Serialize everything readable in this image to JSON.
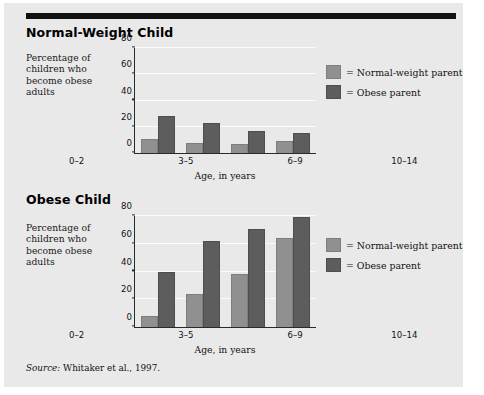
{
  "figure": {
    "source_prefix": "Source:",
    "source_text": "Whitaker et al., 1997."
  },
  "legend": {
    "normal_label": "= Normal-weight parent",
    "obese_label": "= Obese parent",
    "normal_color": "#909090",
    "obese_color": "#5d5d5d"
  },
  "panels": [
    {
      "title": "Normal-Weight Child",
      "ylabel": "Percentage of children who become obese adults",
      "xlabel": "Age, in years"
    },
    {
      "title": "Obese Child",
      "ylabel": "Percentage of children who become obese adults",
      "xlabel": "Age, in years"
    }
  ],
  "axis": {
    "ticks": [
      "0",
      "20",
      "40",
      "60",
      "80"
    ]
  },
  "chart_data": [
    {
      "type": "bar",
      "title": "Normal-Weight Child",
      "categories": [
        "0–2",
        "3–5",
        "6–9",
        "10–14"
      ],
      "series": [
        {
          "name": "Normal-weight parent",
          "values": [
            11,
            8,
            7,
            9
          ],
          "color": "#909090"
        },
        {
          "name": "Obese parent",
          "values": [
            28,
            23,
            17,
            15
          ],
          "color": "#5d5d5d"
        }
      ],
      "xlabel": "Age, in years",
      "ylabel": "Percentage of children who become obese adults",
      "ylim": [
        0,
        80
      ],
      "yticks": [
        0,
        20,
        40,
        60,
        80
      ],
      "grid": true,
      "legend_position": "right"
    },
    {
      "type": "bar",
      "title": "Obese Child",
      "categories": [
        "0–2",
        "3–5",
        "6–9",
        "10–14"
      ],
      "series": [
        {
          "name": "Normal-weight parent",
          "values": [
            8,
            24,
            38,
            64
          ],
          "color": "#909090"
        },
        {
          "name": "Obese parent",
          "values": [
            40,
            62,
            71,
            79
          ],
          "color": "#5d5d5d"
        }
      ],
      "xlabel": "Age, in years",
      "ylabel": "Percentage of children who become obese adults",
      "ylim": [
        0,
        80
      ],
      "yticks": [
        0,
        20,
        40,
        60,
        80
      ],
      "grid": true,
      "legend_position": "right"
    }
  ]
}
